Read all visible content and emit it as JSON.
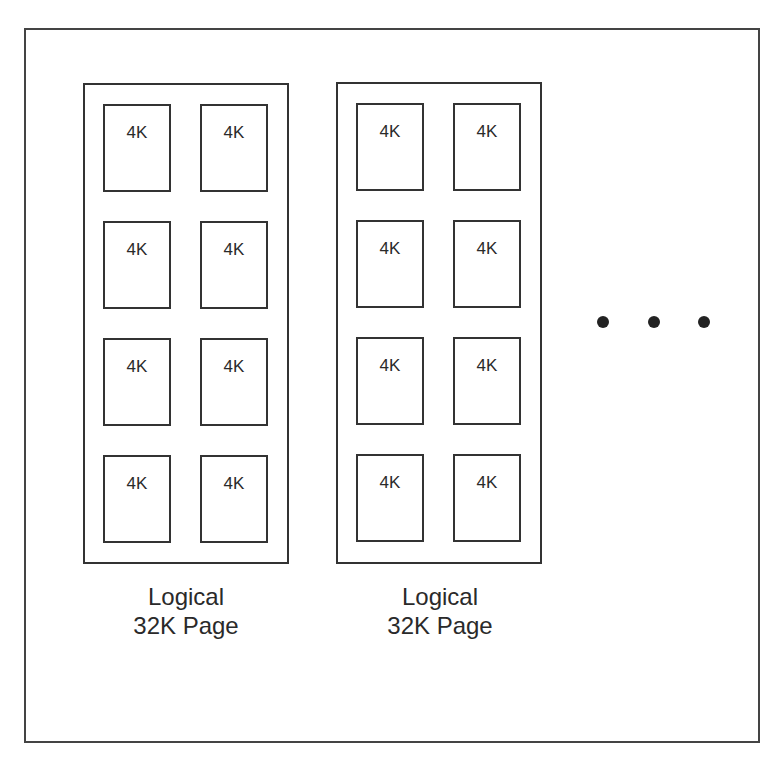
{
  "diagram": {
    "pages": [
      {
        "caption_line1": "Logical",
        "caption_line2": "32K Page",
        "cells": [
          "4K",
          "4K",
          "4K",
          "4K",
          "4K",
          "4K",
          "4K",
          "4K"
        ]
      },
      {
        "caption_line1": "Logical",
        "caption_line2": "32K Page",
        "cells": [
          "4K",
          "4K",
          "4K",
          "4K",
          "4K",
          "4K",
          "4K",
          "4K"
        ]
      }
    ],
    "continuation": "..."
  }
}
